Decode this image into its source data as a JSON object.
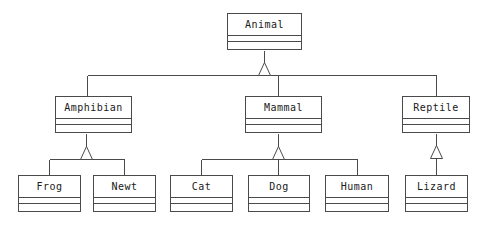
{
  "diagram": {
    "kind": "uml-class-diagram",
    "background_color": "#ffffff",
    "line_color": "#4a4a4a",
    "text_color": "#1a1a1a",
    "relationship_type": "generalization",
    "classes": [
      {
        "id": "animal",
        "name": "Animal",
        "x": 227,
        "y": 13,
        "w": 75,
        "h": 37,
        "attributes": [],
        "methods": []
      },
      {
        "id": "amphibian",
        "name": "Amphibian",
        "x": 55,
        "y": 96,
        "w": 77,
        "h": 37,
        "attributes": [],
        "methods": []
      },
      {
        "id": "mammal",
        "name": "Mammal",
        "x": 245,
        "y": 96,
        "w": 77,
        "h": 37,
        "attributes": [],
        "methods": []
      },
      {
        "id": "reptile",
        "name": "Reptile",
        "x": 402,
        "y": 96,
        "w": 68,
        "h": 37,
        "attributes": [],
        "methods": []
      },
      {
        "id": "frog",
        "name": "Frog",
        "x": 18,
        "y": 175,
        "w": 63,
        "h": 37,
        "attributes": [],
        "methods": []
      },
      {
        "id": "newt",
        "name": "Newt",
        "x": 93,
        "y": 175,
        "w": 63,
        "h": 37,
        "attributes": [],
        "methods": []
      },
      {
        "id": "cat",
        "name": "Cat",
        "x": 170,
        "y": 175,
        "w": 63,
        "h": 37,
        "attributes": [],
        "methods": []
      },
      {
        "id": "dog",
        "name": "Dog",
        "x": 248,
        "y": 175,
        "w": 62,
        "h": 37,
        "attributes": [],
        "methods": []
      },
      {
        "id": "human",
        "name": "Human",
        "x": 325,
        "y": 175,
        "w": 64,
        "h": 37,
        "attributes": [],
        "methods": []
      },
      {
        "id": "lizard",
        "name": "Lizard",
        "x": 405,
        "y": 175,
        "w": 63,
        "h": 37,
        "attributes": [],
        "methods": []
      }
    ],
    "generalizations": [
      {
        "id": "gen-amphibian-animal",
        "child": "amphibian",
        "parent": "animal"
      },
      {
        "id": "gen-mammal-animal",
        "child": "mammal",
        "parent": "animal"
      },
      {
        "id": "gen-reptile-animal",
        "child": "reptile",
        "parent": "animal"
      },
      {
        "id": "gen-frog-amphibian",
        "child": "frog",
        "parent": "amphibian"
      },
      {
        "id": "gen-newt-amphibian",
        "child": "newt",
        "parent": "amphibian"
      },
      {
        "id": "gen-cat-mammal",
        "child": "cat",
        "parent": "mammal"
      },
      {
        "id": "gen-dog-mammal",
        "child": "dog",
        "parent": "mammal"
      },
      {
        "id": "gen-human-mammal",
        "child": "human",
        "parent": "mammal"
      },
      {
        "id": "gen-lizard-reptile",
        "child": "lizard",
        "parent": "reptile"
      }
    ]
  }
}
